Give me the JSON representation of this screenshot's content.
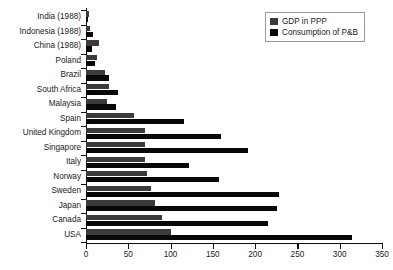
{
  "chart_data": {
    "type": "bar",
    "orientation": "horizontal",
    "title": "",
    "xlabel": "",
    "ylabel": "",
    "xlim": [
      0,
      350
    ],
    "xticks": [
      0,
      50,
      100,
      150,
      200,
      250,
      300,
      350
    ],
    "grid": false,
    "legend_position": "top-right",
    "categories": [
      "India (1988)",
      "Indonesia (1988)",
      "China (1988)",
      "Poland",
      "Brazil",
      "South Africa",
      "Malaysia",
      "Spain",
      "United Kingdom",
      "Singapore",
      "Italy",
      "Norway",
      "Sweden",
      "Japan",
      "Canada",
      "USA"
    ],
    "series": [
      {
        "name": "GDP in PPP",
        "color": "#3b3b3b",
        "values": [
          3,
          5,
          15,
          13,
          22,
          27,
          25,
          57,
          70,
          70,
          70,
          72,
          77,
          81,
          90,
          100
        ]
      },
      {
        "name": "Consumption of P&B",
        "color": "#080808",
        "values": [
          2,
          8,
          7,
          11,
          27,
          38,
          36,
          116,
          160,
          191,
          122,
          157,
          228,
          226,
          215,
          315
        ]
      }
    ]
  },
  "legend": {
    "items": [
      {
        "label": "GDP in PPP"
      },
      {
        "label": "Consumption of P&B"
      }
    ]
  },
  "colors": {
    "gdp": "#3b3b3b",
    "consumption": "#080808",
    "axis": "#111111",
    "text": "#1a1a1a",
    "background": "#ffffff"
  }
}
